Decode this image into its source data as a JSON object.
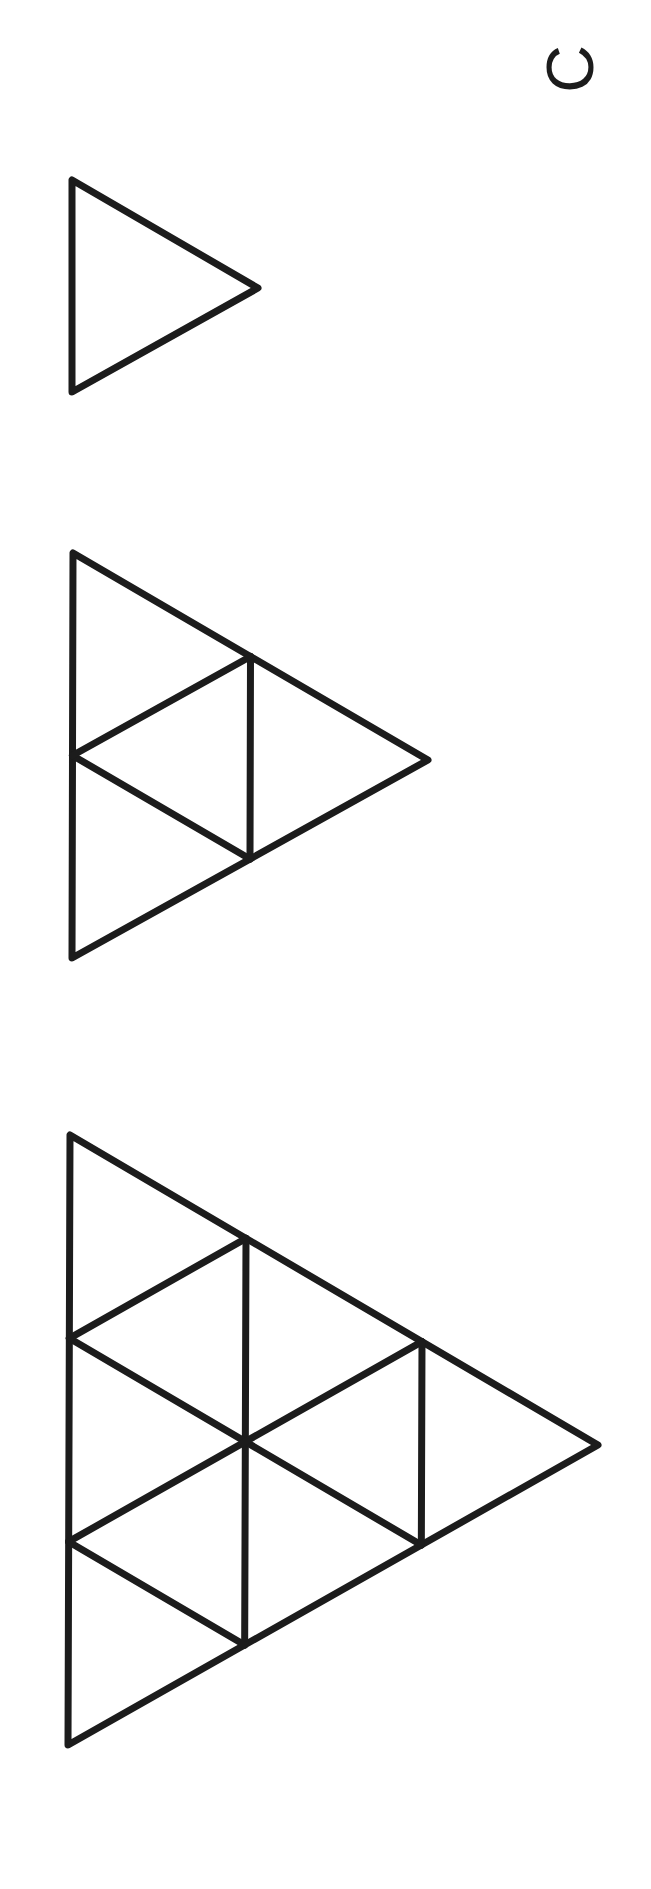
{
  "page": {
    "background": "#ffffff",
    "stroke_color": "#1c1c1c",
    "stroke_width": 7
  },
  "label": {
    "text": "C",
    "orientation": "rotated-90"
  },
  "figures": [
    {
      "name": "stage-1-triangle",
      "subdivisions": 1,
      "vertices": [
        [
          72,
          180
        ],
        [
          72,
          392
        ],
        [
          258,
          288
        ]
      ]
    },
    {
      "name": "stage-2-triangle",
      "subdivisions": 2,
      "vertices": [
        [
          73,
          553
        ],
        [
          72,
          958
        ],
        [
          428,
          760
        ]
      ]
    },
    {
      "name": "stage-3-triangle",
      "subdivisions": 3,
      "vertices": [
        [
          70,
          1135
        ],
        [
          68,
          1745
        ],
        [
          598,
          1445
        ]
      ]
    }
  ]
}
